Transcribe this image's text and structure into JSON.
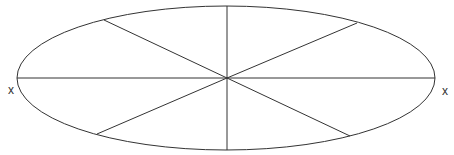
{
  "diagram": {
    "type": "ellipse-with-radial-spokes",
    "canvas": {
      "width": 454,
      "height": 155
    },
    "stroke_color": "#333333",
    "background": "#ffffff",
    "ellipse": {
      "cx": 226,
      "cy": 78,
      "rx": 209,
      "ry": 72
    },
    "center": {
      "x": 227,
      "y": 78
    },
    "spokes": [
      {
        "name": "left",
        "x": 17,
        "y": 78
      },
      {
        "name": "right",
        "x": 435,
        "y": 78
      },
      {
        "name": "top",
        "x": 227,
        "y": 6
      },
      {
        "name": "bottom",
        "x": 227,
        "y": 150
      },
      {
        "name": "upper-left",
        "x": 104,
        "y": 20
      },
      {
        "name": "upper-right",
        "x": 357,
        "y": 23
      },
      {
        "name": "lower-left",
        "x": 97,
        "y": 134
      },
      {
        "name": "lower-right",
        "x": 350,
        "y": 136
      }
    ],
    "labels": [
      {
        "name": "left-x-label",
        "text": "x",
        "x": 8,
        "y": 84
      },
      {
        "name": "right-x-label",
        "text": "x",
        "x": 442,
        "y": 85
      }
    ]
  }
}
